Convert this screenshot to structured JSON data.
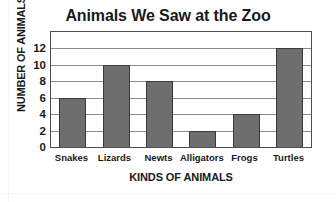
{
  "chart_data": {
    "type": "bar",
    "title": "Animals We Saw at the Zoo",
    "xlabel": "KINDS OF ANIMALS",
    "ylabel": "NUMBER OF ANIMALS",
    "categories": [
      "Snakes",
      "Lizards",
      "Newts",
      "Alligators",
      "Frogs",
      "Turtles"
    ],
    "values": [
      6,
      10,
      8,
      2,
      4,
      12
    ],
    "ylim": [
      0,
      14
    ],
    "yticks": [
      0,
      2,
      4,
      6,
      8,
      10,
      12
    ],
    "ytick_labels": [
      "0",
      "2",
      "4",
      "6",
      "8",
      "10",
      "12"
    ],
    "grid": true,
    "legend": false,
    "colors": {
      "bar_fill": "#6e6e6e",
      "bar_edge": "#3a3a3a",
      "plot_background": "#ffffff",
      "gridline": "#8c8c8c",
      "axis_frame": "#4d4d4d",
      "text": "#1a1a1a"
    }
  }
}
